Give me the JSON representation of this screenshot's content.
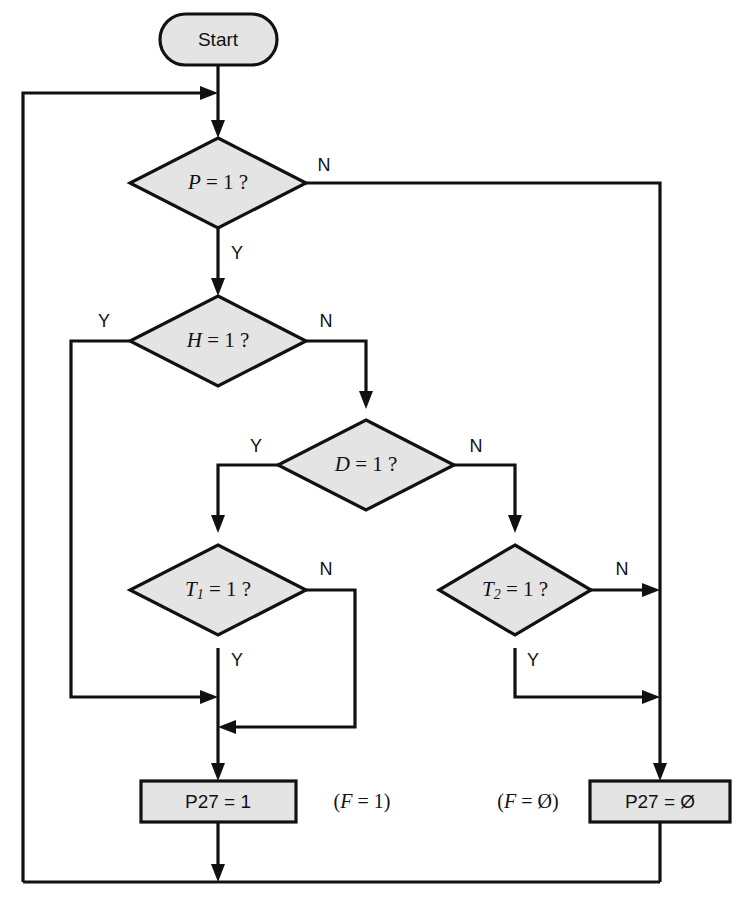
{
  "diagram": {
    "colors": {
      "node_fill": "#e4e4e4",
      "stroke": "#111111",
      "background": "#ffffff"
    },
    "nodes": {
      "start": {
        "label": "Start",
        "shape": "terminator"
      },
      "decision_p": {
        "var": "P",
        "rel": " = 1 ?",
        "shape": "decision"
      },
      "decision_h": {
        "var": "H",
        "rel": " = 1 ?",
        "shape": "decision"
      },
      "decision_d": {
        "var": "D",
        "rel": " = 1 ?",
        "shape": "decision"
      },
      "decision_t1": {
        "var": "T",
        "sub": "1",
        "rel": " = 1 ?",
        "shape": "decision"
      },
      "decision_t2": {
        "var": "T",
        "sub": "2",
        "rel": " = 1 ?",
        "shape": "decision"
      },
      "process_p27_one": {
        "label": "P27 = 1",
        "shape": "process"
      },
      "process_p27_zero": {
        "label": "P27 = Ø",
        "shape": "process"
      }
    },
    "annotations": {
      "f_equals_one": "(F = 1)",
      "f_equals_zero": "(F = Ø)",
      "f_one_var": "F",
      "f_one_rest": " = 1)",
      "f_zero_var": "F",
      "f_zero_rest": " = Ø)",
      "paren_open": "("
    },
    "branch_labels": {
      "p_no": "N",
      "p_yes": "Y",
      "h_yes": "Y",
      "h_no": "N",
      "d_yes": "Y",
      "d_no": "N",
      "t1_no": "N",
      "t1_yes": "Y",
      "t2_no": "N",
      "t2_yes": "Y"
    }
  }
}
